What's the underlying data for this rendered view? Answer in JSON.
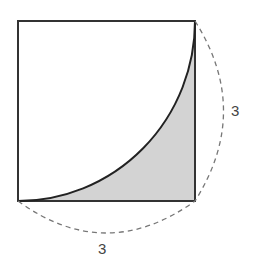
{
  "diagram": {
    "type": "geometry",
    "shape": "square with inscribed quarter-circle arc",
    "side_right_label": "3",
    "side_bottom_label": "3",
    "colors": {
      "stroke": "#333333",
      "shade": "#d3d3d3",
      "dash": "#777777"
    }
  }
}
